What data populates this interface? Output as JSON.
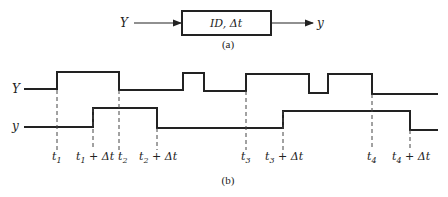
{
  "figure_a": {
    "input_label": "Y",
    "block_label": "ID, Δt",
    "output_label": "y",
    "caption": "(a)"
  },
  "figure_b": {
    "caption": "(b)",
    "signals": [
      {
        "name": "Y",
        "label": "Y",
        "transitions_px": [
          57,
          119,
          183,
          204,
          246,
          309,
          328,
          372
        ]
      },
      {
        "name": "y",
        "label": "y",
        "transitions_px": [
          93,
          157,
          283,
          410
        ]
      }
    ],
    "time_labels": [
      {
        "id": "t1",
        "base": "t",
        "sub": "1",
        "suffix": ""
      },
      {
        "id": "t1_dt",
        "base": "t",
        "sub": "1",
        "suffix": " + Δt"
      },
      {
        "id": "t2",
        "base": "t",
        "sub": "2",
        "suffix": ""
      },
      {
        "id": "t2_dt",
        "base": "t",
        "sub": "2",
        "suffix": " + Δt"
      },
      {
        "id": "t3",
        "base": "t",
        "sub": "3",
        "suffix": ""
      },
      {
        "id": "t3_dt",
        "base": "t",
        "sub": "3",
        "suffix": " + Δt"
      },
      {
        "id": "t4",
        "base": "t",
        "sub": "4",
        "suffix": ""
      },
      {
        "id": "t4_dt",
        "base": "t",
        "sub": "4",
        "suffix": " + Δt"
      }
    ]
  },
  "colors": {
    "ink": "#222222",
    "background": "#ffffff"
  }
}
